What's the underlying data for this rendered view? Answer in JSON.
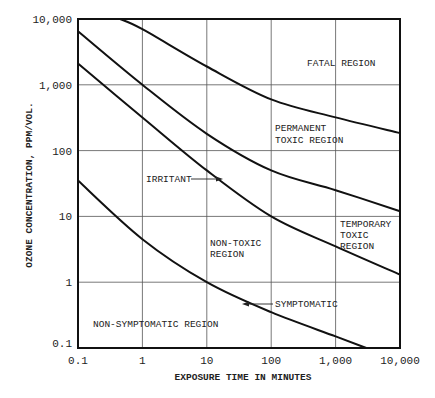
{
  "chart_data": {
    "type": "line",
    "title": "",
    "xlabel": "EXPOSURE TIME IN MINUTES",
    "ylabel": "OZONE CONCENTRATION, PPM/VOL.",
    "xscale": "log",
    "yscale": "log",
    "xlim": [
      0.1,
      10000
    ],
    "ylim": [
      0.1,
      10000
    ],
    "grid": true,
    "x_ticks": [
      "0.1",
      "1",
      "10",
      "100",
      "1,000",
      "10,000"
    ],
    "y_ticks": [
      "0.1",
      "1",
      "10",
      "100",
      "1,000",
      "10,000"
    ],
    "x_tick_values": [
      0.1,
      1,
      10,
      100,
      1000,
      10000
    ],
    "y_tick_values": [
      0.1,
      1,
      10,
      100,
      1000,
      10000
    ],
    "series": [
      {
        "name": "Fatal boundary",
        "x": [
          0.45,
          1,
          10,
          100,
          1000,
          10000
        ],
        "y": [
          10000,
          7000,
          1900,
          600,
          320,
          185
        ]
      },
      {
        "name": "Permanent toxic boundary",
        "x": [
          0.1,
          1,
          10,
          100,
          1000,
          10000
        ],
        "y": [
          6500,
          1000,
          180,
          50,
          25,
          12
        ]
      },
      {
        "name": "Irritant",
        "x": [
          0.1,
          1,
          10,
          100,
          1000,
          10000
        ],
        "y": [
          2100,
          320,
          50,
          10,
          3.5,
          1.3
        ]
      },
      {
        "name": "Symptomatic",
        "x": [
          0.1,
          1,
          10,
          100,
          1000,
          3000
        ],
        "y": [
          35,
          4.5,
          1.0,
          0.35,
          0.15,
          0.1
        ]
      }
    ],
    "annotations": {
      "fatal": "FATAL REGION",
      "permanent_line1": "PERMANENT",
      "permanent_line2": "TOXIC REGION",
      "irritant": "IRRITANT",
      "temporary_line1": "TEMPORARY",
      "temporary_line2": "TOXIC",
      "temporary_line3": "REGION",
      "nontoxic_line1": "NON-TOXIC",
      "nontoxic_line2": "REGION",
      "symptomatic": "SYMPTOMATIC",
      "nonsymptomatic": "NON-SYMPTOMATIC REGION"
    }
  }
}
